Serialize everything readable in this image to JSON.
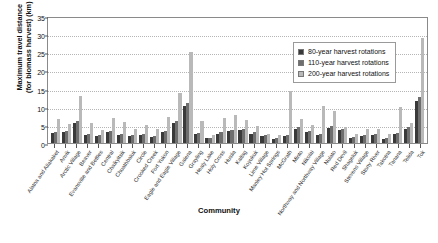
{
  "chart_data": {
    "type": "bar",
    "title": "",
    "xlabel": "Community",
    "ylabel": "Maximum travel distance (for biomass harvest) (km)",
    "ylabel_lines": [
      "Maximum travel distance",
      "(for biomass harvest) (km)"
    ],
    "ylim": [
      0,
      35
    ],
    "yticks": [
      0,
      5,
      10,
      15,
      20,
      25,
      30,
      35
    ],
    "grid": true,
    "grid_style": "dotted horizontal",
    "legend_position": "top-right inside",
    "categories": [
      "Alatna and Allakaket",
      "Anvik",
      "Arctic Village",
      "Beaver",
      "Evansville and Bettles",
      "Central",
      "Chalkyitsik",
      "Chuathbaluk",
      "Circle",
      "Crooked Creek",
      "Fort Yukon",
      "Eagle and Eagle Village",
      "Galena",
      "Grayling",
      "Healy Lake",
      "Holy Cross",
      "Huslia",
      "Kaltag",
      "Koyukuk",
      "Lime Village",
      "Manley Hot Springs",
      "McGrath",
      "Minto",
      "Nikolai",
      "Northway and Northway Village",
      "Nulato",
      "Red Devil",
      "Shageluk",
      "Stevens Village",
      "Stony River",
      "Takotna",
      "Tanana",
      "Telida",
      "Tok"
    ],
    "series": [
      {
        "name": "80-year harvest rotations",
        "color": "#3a3a3a",
        "values": [
          2.7,
          2.9,
          5.4,
          2.2,
          2.0,
          3.1,
          2.3,
          1.9,
          2.1,
          1.7,
          3.0,
          5.6,
          10.2,
          2.5,
          1.3,
          2.6,
          3.3,
          3.5,
          2.6,
          2.0,
          1.2,
          1.9,
          4.0,
          3.1,
          2.3,
          4.2,
          3.6,
          1.5,
          1.9,
          2.1,
          1.2,
          2.4,
          3.9,
          11.5
        ]
      },
      {
        "name": "110-year harvest rotations",
        "color": "#6e6e6e",
        "values": [
          3.0,
          3.4,
          6.0,
          2.5,
          2.3,
          3.4,
          2.6,
          2.1,
          2.4,
          2.0,
          3.3,
          6.2,
          11.0,
          2.8,
          1.5,
          3.0,
          3.7,
          3.9,
          2.9,
          2.3,
          1.4,
          2.2,
          4.4,
          3.4,
          2.6,
          4.6,
          3.9,
          1.7,
          2.2,
          2.4,
          1.4,
          2.7,
          4.3,
          12.8
        ]
      },
      {
        "name": "200-year harvest rotations",
        "color": "#b9b9b9",
        "values": [
          6.5,
          5.2,
          12.9,
          5.5,
          3.7,
          6.8,
          5.7,
          3.9,
          4.9,
          3.9,
          7.2,
          13.8,
          25.0,
          6.2,
          2.3,
          6.9,
          7.8,
          6.3,
          4.8,
          2.4,
          2.1,
          14.2,
          6.7,
          5.1,
          10.3,
          8.7,
          4.5,
          2.5,
          4.0,
          3.8,
          2.6,
          9.8,
          5.6,
          29.0
        ]
      }
    ]
  },
  "legend": {
    "items": [
      {
        "label": "80-year harvest rotations",
        "color": "#3a3a3a"
      },
      {
        "label": "110-year harvest rotations",
        "color": "#6e6e6e"
      },
      {
        "label": "200-year harvest rotations",
        "color": "#b9b9b9"
      }
    ]
  }
}
